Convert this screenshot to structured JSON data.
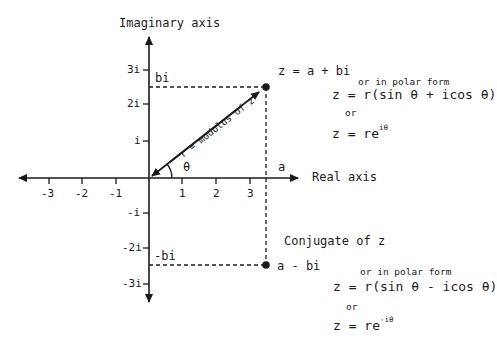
{
  "axes": {
    "imaginary_label": "Imaginary axis",
    "real_label": "Real axis",
    "x_ticks": [
      "-3",
      "-2",
      "-1",
      "1",
      "2",
      "3"
    ],
    "y_ticks": [
      "3i",
      "2i",
      "i",
      "-i",
      "-2i",
      "-3i"
    ]
  },
  "point_z": {
    "projection_imag": "bi",
    "projection_real": "a",
    "title": "z = a + bi",
    "polar_caption": "or in polar form",
    "polar_eq": "z = r(sin θ + icos θ)",
    "or": "or",
    "exp_base": "z = re",
    "exp_power": "iθ"
  },
  "modulus_label": "r = modulus of z",
  "angle_label": "θ",
  "conjugate": {
    "title": "Conjugate of z",
    "projection_imag": "-bi",
    "point_label": "a - bi",
    "polar_caption": "or in polar form",
    "polar_eq": "z = r(sin θ - icos θ)",
    "or": "or",
    "exp_base": "z = re",
    "exp_power": "-iθ"
  },
  "colors": {
    "ink": "#1a1a1a",
    "background": "#ffffff"
  }
}
